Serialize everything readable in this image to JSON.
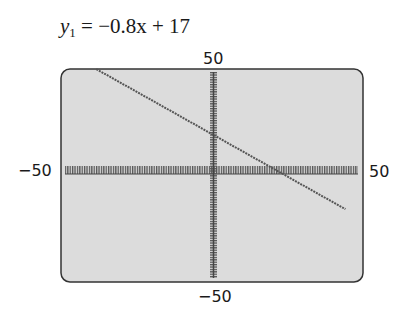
{
  "title": {
    "var": "y",
    "sub": "1",
    "rhs": " = −0.8x + 17"
  },
  "chart_data": {
    "type": "line",
    "title": "y1 = −0.8x + 17",
    "equation": {
      "slope": -0.8,
      "intercept": 17
    },
    "series": [
      {
        "name": "y1",
        "x": [
          -40,
          -20,
          0,
          21.25,
          40,
          45
        ],
        "values": [
          49,
          33,
          17,
          0,
          -15,
          -19
        ]
      }
    ],
    "xlim": [
      -50,
      50
    ],
    "ylim": [
      -50,
      50
    ],
    "xlabel": "",
    "ylabel": "",
    "tick_labels": {
      "xmin": "−50",
      "xmax": "50",
      "ymin": "−50",
      "ymax": "50"
    },
    "grid": false,
    "axis_ticks": true,
    "style": {
      "screen_bg": "#dcdcdc",
      "line_color": "#555555",
      "axis_color": "#444444"
    }
  },
  "labels": {
    "ymax": "50",
    "ymin": "−50",
    "xmin": "−50",
    "xmax": "50"
  }
}
